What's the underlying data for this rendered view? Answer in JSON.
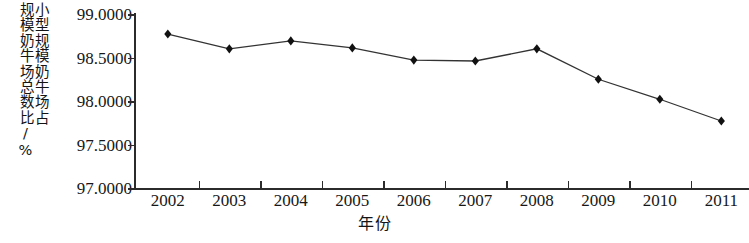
{
  "chart_data": {
    "type": "line",
    "title": "",
    "xlabel": "年份",
    "ylabel": "小型规模奶牛场占规模奶牛场总数比/%",
    "ylabel_lines": [
      "小型规模奶牛场占",
      "规模奶牛场总数比/%"
    ],
    "categories": [
      "2002",
      "2003",
      "2004",
      "2005",
      "2006",
      "2007",
      "2008",
      "2009",
      "2010",
      "2011"
    ],
    "x": [
      2002,
      2003,
      2004,
      2005,
      2006,
      2007,
      2008,
      2009,
      2010,
      2011
    ],
    "values": [
      98.77,
      98.6,
      98.69,
      98.61,
      98.47,
      98.46,
      98.6,
      98.25,
      98.02,
      97.77
    ],
    "series": [
      {
        "name": "小型规模奶牛场占规模奶牛场总数比",
        "values": [
          98.77,
          98.6,
          98.69,
          98.61,
          98.47,
          98.46,
          98.6,
          98.25,
          98.02,
          97.77
        ]
      }
    ],
    "ylim": [
      97.0,
      99.0
    ],
    "yticks": [
      97.0,
      97.5,
      98.0,
      98.5,
      99.0
    ],
    "ytick_labels": [
      "97.0000",
      "97.5000",
      "98.0000",
      "98.5000",
      "99.0000"
    ],
    "grid": false,
    "legend": false,
    "marker": "diamond",
    "line_color": "#333333",
    "marker_color": "#111111",
    "axis_color": "#2b2b2b",
    "background_color": "#ffffff"
  }
}
